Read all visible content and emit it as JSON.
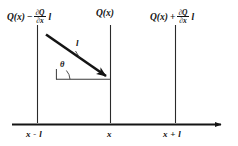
{
  "figure": {
    "name": "flux-gradient-diagram",
    "background_color": "#ffffff",
    "ink_color": "#141414"
  },
  "top_labels": {
    "left": {
      "function": "Q(x)",
      "operator": "−",
      "numerator": "∂Q",
      "denominator": "∂x",
      "length": "l"
    },
    "center": {
      "function": "Q(x)"
    },
    "right": {
      "function": "Q(x)",
      "operator": "+",
      "numerator": "∂Q",
      "denominator": "∂x",
      "length": "l"
    }
  },
  "axis": {
    "ticks": [
      {
        "label": "x - l"
      },
      {
        "label": "x"
      },
      {
        "label": "x + l"
      }
    ]
  },
  "annotations": {
    "vector_length": "l",
    "angle": "θ"
  }
}
